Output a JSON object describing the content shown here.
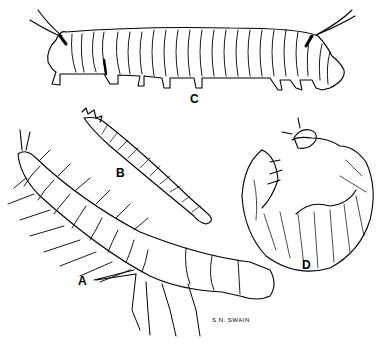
{
  "illustration": {
    "subject": "Insect larvae line drawings",
    "figures": [
      {
        "label": "A",
        "description": "elongate larva with long lateral filaments, three pairs of thoracic legs, head at lower right"
      },
      {
        "label": "B",
        "description": "slender cylindrical segmented larva, spiny head at upper left"
      },
      {
        "label": "C",
        "description": "caterpillar with long filaments at both ends, prolegs below"
      },
      {
        "label": "D",
        "description": "C-shaped grub with hairy body and legs near head"
      }
    ],
    "signature": "S.N. SWAIN",
    "colors": {
      "ink": "#000000",
      "paper": "#ffffff"
    }
  }
}
